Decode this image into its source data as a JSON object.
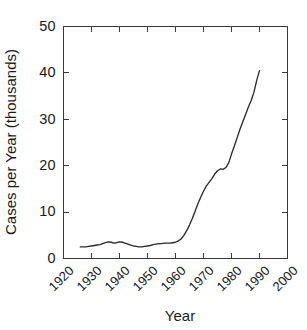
{
  "chart_data": {
    "type": "line",
    "title": "",
    "xlabel": "Year",
    "ylabel": "Cases per Year (thousands)",
    "xlim": [
      1920,
      2000
    ],
    "ylim": [
      0,
      50
    ],
    "grid": false,
    "legend": null,
    "xticks": [
      1920,
      1930,
      1940,
      1950,
      1960,
      1970,
      1980,
      1990,
      2000
    ],
    "xtick_labels": [
      "1920",
      "1930",
      "1940",
      "1950",
      "1960",
      "1970",
      "1980",
      "1990",
      "2000"
    ],
    "yticks": [
      0,
      10,
      20,
      30,
      40,
      50
    ],
    "ytick_labels": [
      "0",
      "10",
      "20",
      "30",
      "40",
      "50"
    ],
    "series": [
      {
        "name": "Cases per Year",
        "color": "#2b2b2b",
        "x": [
          1926,
          1927,
          1928,
          1929,
          1930,
          1931,
          1932,
          1933,
          1934,
          1935,
          1936,
          1937,
          1938,
          1939,
          1940,
          1941,
          1942,
          1943,
          1944,
          1945,
          1946,
          1947,
          1948,
          1949,
          1950,
          1951,
          1952,
          1953,
          1954,
          1955,
          1956,
          1957,
          1958,
          1959,
          1960,
          1961,
          1962,
          1963,
          1964,
          1965,
          1966,
          1967,
          1968,
          1969,
          1970,
          1971,
          1972,
          1973,
          1974,
          1975,
          1976,
          1977,
          1978,
          1979,
          1980,
          1981,
          1982,
          1983,
          1984,
          1985,
          1986,
          1987,
          1988,
          1989,
          1990
        ],
        "values": [
          2.5,
          2.5,
          2.5,
          2.6,
          2.7,
          2.8,
          2.9,
          3.0,
          3.2,
          3.4,
          3.6,
          3.5,
          3.3,
          3.4,
          3.6,
          3.5,
          3.3,
          3.1,
          2.9,
          2.7,
          2.6,
          2.5,
          2.5,
          2.6,
          2.7,
          2.8,
          3.0,
          3.1,
          3.2,
          3.2,
          3.3,
          3.3,
          3.3,
          3.4,
          3.5,
          3.8,
          4.2,
          5.0,
          6.0,
          7.2,
          8.6,
          10.2,
          11.8,
          13.2,
          14.5,
          15.6,
          16.4,
          17.2,
          18.2,
          18.9,
          19.3,
          19.2,
          19.6,
          20.6,
          22.5,
          24.2,
          26.0,
          27.8,
          29.4,
          31.0,
          32.6,
          34.0,
          35.8,
          38.4,
          40.5
        ]
      }
    ]
  },
  "axes": {
    "y_title": "Cases per Year (thousands)",
    "x_title": "Year"
  }
}
